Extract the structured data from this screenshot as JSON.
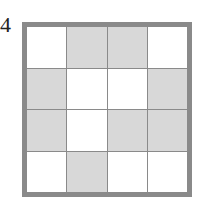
{
  "label": "4",
  "colors": {
    "border": "#8a8a8a",
    "shaded": "#d8d8d8",
    "empty": "#ffffff"
  },
  "grid": {
    "rows": 4,
    "cols": 4,
    "cells": [
      [
        0,
        1,
        1,
        0
      ],
      [
        1,
        0,
        0,
        1
      ],
      [
        1,
        0,
        1,
        1
      ],
      [
        0,
        1,
        0,
        0
      ]
    ]
  }
}
